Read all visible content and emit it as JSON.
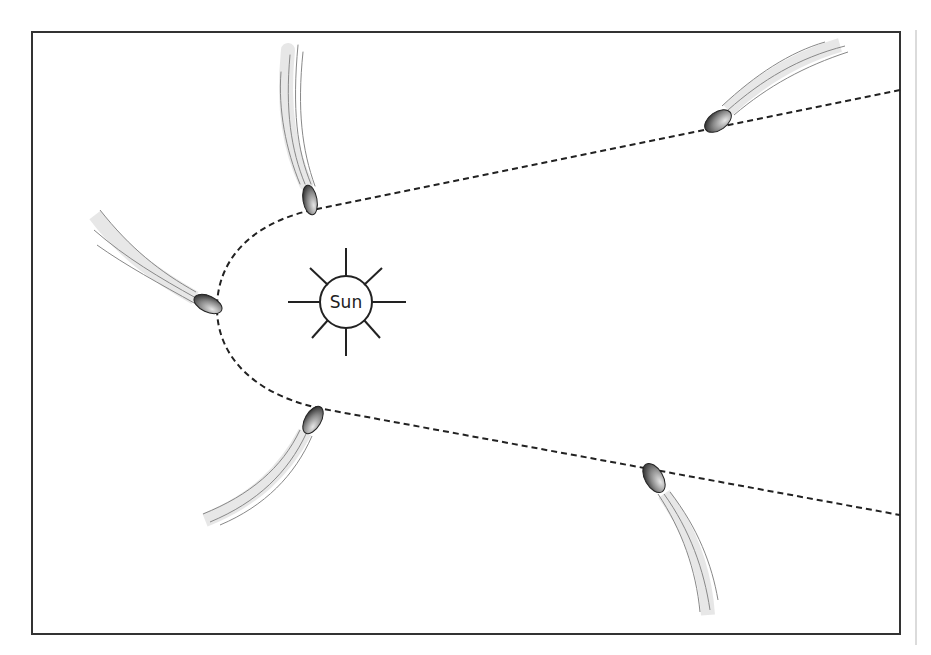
{
  "diagram": {
    "sun": {
      "label": "Sun",
      "cx": 346,
      "cy": 302,
      "r": 26
    },
    "orbit": {
      "style": "dashed",
      "shape": "parabola",
      "vertex": [
        217,
        308
      ]
    },
    "comets": [
      {
        "id": "comet-upper-left",
        "head": [
          310,
          200
        ],
        "tail_direction": "up"
      },
      {
        "id": "comet-left",
        "head": [
          208,
          304
        ],
        "tail_direction": "upper-left"
      },
      {
        "id": "comet-lower-left",
        "head": [
          313,
          420
        ],
        "tail_direction": "lower-left"
      },
      {
        "id": "comet-upper-right",
        "head": [
          718,
          121
        ],
        "tail_direction": "upper-right"
      },
      {
        "id": "comet-lower-right",
        "head": [
          654,
          478
        ],
        "tail_direction": "down"
      }
    ],
    "colors": {
      "frame": "#333333",
      "orbit": "#222222",
      "tail": "#9a9a9a",
      "nucleus_dark": "#333333",
      "nucleus_light": "#dddddd",
      "side_rule": "#cccccc"
    }
  }
}
